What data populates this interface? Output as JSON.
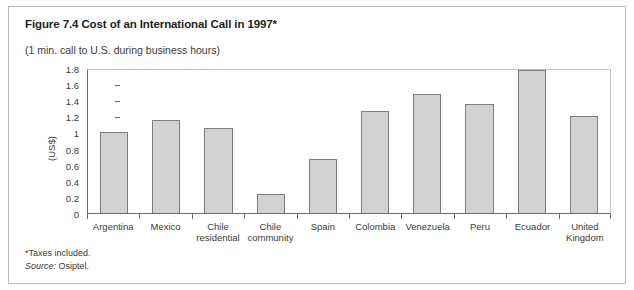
{
  "figure": {
    "title": "Figure 7.4 Cost of an International Call in 1997*",
    "subtitle": "(1 min. call to U.S. during business hours)",
    "footnote_taxes": "*Taxes included.",
    "footnote_source_label": "Source:",
    "footnote_source_value": "Osiptel."
  },
  "colors": {
    "bar_fill": "#d2d2d2",
    "bar_border": "#7d7d7d",
    "axis": "#6d6d6d",
    "frame": "#b9b9b9",
    "text": "#231f20"
  },
  "chart_data": {
    "type": "bar",
    "title": "Figure 7.4 Cost of an International Call in 1997*",
    "subtitle": "(1 min. call to U.S. during business hours)",
    "xlabel": "",
    "ylabel": "(US$)",
    "ylim": [
      0,
      1.8
    ],
    "yticks": [
      0,
      0.2,
      0.4,
      0.6,
      0.8,
      1,
      1.2,
      1.4,
      1.6,
      1.8
    ],
    "ytick_labels": [
      "0",
      "0.2",
      "0.4",
      "0.6",
      "0.8",
      "1",
      "1.2",
      "1.4",
      "1.6",
      "1.8"
    ],
    "grid": false,
    "legend": "none",
    "categories": [
      "Argentina",
      "Mexico",
      "Chile\nresidential",
      "Chile\ncommunity",
      "Spain",
      "Colombia",
      "Venezuela",
      "Peru",
      "Ecuador",
      "United\nKingdom"
    ],
    "values": [
      1.0,
      1.15,
      1.05,
      0.24,
      0.67,
      1.27,
      1.48,
      1.35,
      1.78,
      1.2
    ]
  }
}
